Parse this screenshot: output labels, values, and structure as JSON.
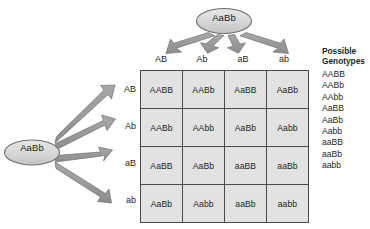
{
  "diagram": {
    "type": "punnett-square",
    "top_parent": {
      "label": "AaBb"
    },
    "left_parent": {
      "label": "AaBb"
    },
    "column_headers": [
      "AB",
      "Ab",
      "aB",
      "ab"
    ],
    "row_headers": [
      "AB",
      "Ab",
      "aB",
      "ab"
    ],
    "grid": [
      [
        "AABB",
        "AABb",
        "AaBB",
        "AaBb"
      ],
      [
        "AABb",
        "AAbb",
        "AaBb",
        "Aabb"
      ],
      [
        "AaBB",
        "AaBb",
        "aaBB",
        "aaBb"
      ],
      [
        "AaBb",
        "Aabb",
        "aaBb",
        "aabb"
      ]
    ],
    "top_arrow_count": 4,
    "left_arrow_count": 4
  },
  "genotype_key": {
    "title": "Possible\nGenotypes",
    "items": [
      "AABB",
      "AABb",
      "AAbb",
      "AaBB",
      "AaBb",
      "Aabb",
      "aaBB",
      "aaBb",
      "aabb"
    ]
  },
  "colors": {
    "cell_fill": "#e2e2e2",
    "cell_border": "#4a4a4a",
    "ellipse_fill": "#d4d4d4",
    "ellipse_stroke": "#6e6e6e",
    "arrow_fill": "#9a9a9a",
    "arrow_stroke": "#6a6a6a",
    "text": "#231f20",
    "background": "#ffffff"
  }
}
